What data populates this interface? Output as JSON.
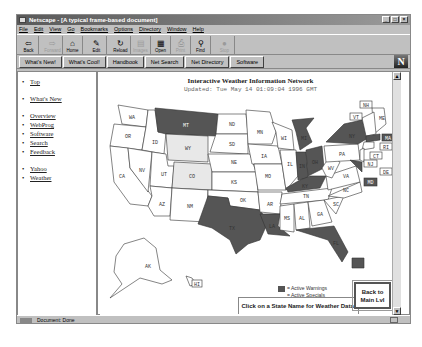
{
  "window": {
    "title": "Netscape - [A typical frame-based document]",
    "controls": [
      "_",
      "□",
      "×"
    ]
  },
  "menubar": [
    "File",
    "Edit",
    "View",
    "Go",
    "Bookmarks",
    "Options",
    "Directory",
    "Window",
    "Help"
  ],
  "toolbar": [
    {
      "label": "Back",
      "icon": "back-arrow-icon",
      "glyph": "⇦",
      "enabled": true
    },
    {
      "label": "Forward",
      "icon": "forward-arrow-icon",
      "glyph": "⇨",
      "enabled": false
    },
    {
      "label": "Home",
      "icon": "home-icon",
      "glyph": "⌂",
      "enabled": true
    },
    {
      "label": "Edit",
      "icon": "pencil-icon",
      "glyph": "✎",
      "enabled": true
    },
    {
      "label": "Reload",
      "icon": "reload-icon",
      "glyph": "↻",
      "enabled": true
    },
    {
      "label": "Images",
      "icon": "images-icon",
      "glyph": "▤",
      "enabled": false
    },
    {
      "label": "Open",
      "icon": "open-icon",
      "glyph": "▦",
      "enabled": true
    },
    {
      "label": "Print",
      "icon": "printer-icon",
      "glyph": "⎙",
      "enabled": false
    },
    {
      "label": "Find",
      "icon": "binoculars-icon",
      "glyph": "⚲",
      "enabled": true
    },
    {
      "label": "Stop",
      "icon": "stop-icon",
      "glyph": "●",
      "enabled": false
    }
  ],
  "directory_buttons": [
    "What's New!",
    "What's Cool!",
    "Handbook",
    "Net Search",
    "Net Directory",
    "Software"
  ],
  "logo": "N",
  "sidebar": {
    "groups": [
      [
        "Top"
      ],
      [
        "What's New"
      ],
      [
        "Overview",
        "WebProg",
        "Software",
        "Search",
        "Feedback"
      ],
      [
        "Yahoo",
        "Weather"
      ]
    ]
  },
  "map": {
    "title": "Interactive Weather Information Network",
    "updated": "Updated: Tue May 14 01:09:04 1996 GMT",
    "colors": {
      "warning": "#555555",
      "special": "#e8e8e8",
      "normal": "#ffffff",
      "outline": "#333333"
    },
    "states": {
      "warnings": [
        "MT",
        "TX",
        "LA",
        "MI",
        "IN",
        "OH",
        "KY",
        "NY",
        "MA",
        "MD",
        "FL",
        "PR"
      ],
      "specials": [
        "WY",
        "CO"
      ],
      "labels": [
        "WA",
        "OR",
        "CA",
        "ID",
        "NV",
        "UT",
        "AZ",
        "MT",
        "WY",
        "CO",
        "NM",
        "ND",
        "SD",
        "NE",
        "KS",
        "OK",
        "TX",
        "MN",
        "IA",
        "MO",
        "AR",
        "LA",
        "WI",
        "IL",
        "MI",
        "IN",
        "OH",
        "KY",
        "TN",
        "MS",
        "AL",
        "GA",
        "FL",
        "SC",
        "NC",
        "VA",
        "WV",
        "PA",
        "NY",
        "VT",
        "NH",
        "ME",
        "MA",
        "RI",
        "CT",
        "NJ",
        "DE",
        "MD",
        "AK",
        "HI"
      ]
    },
    "legend": {
      "warnings": "= Active Warnings",
      "specials": "= Active Specials"
    },
    "instruction": "Click on a State Name for Weather Data.",
    "back_button": "Back to Main Lvl"
  },
  "status": {
    "text": "Document: Done"
  }
}
